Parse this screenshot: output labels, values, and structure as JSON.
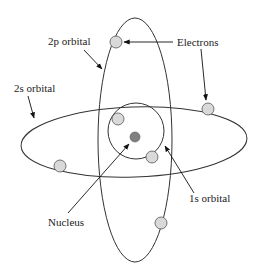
{
  "diagram": {
    "labels": {
      "p2": "2p orbital",
      "s2": "2s orbital",
      "electrons": "Electrons",
      "nucleus": "Nucleus",
      "s1": "1s orbital"
    },
    "colors": {
      "line": "#333333",
      "electron_fill": "#d9d9d9",
      "nucleus_fill": "#808080"
    }
  }
}
